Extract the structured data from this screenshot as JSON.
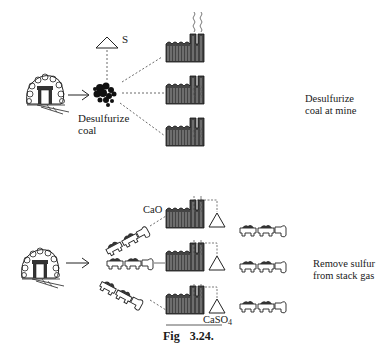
{
  "figure": {
    "caption_prefix": "Fig",
    "caption_number": "3.24."
  },
  "top_panel": {
    "sulfur_label": "S",
    "coal_label_line1": "Desulfurize",
    "coal_label_line2": "coal",
    "side_label_line1": "Desulfurize",
    "side_label_line2": "coal at mine",
    "power_plants": 3
  },
  "bottom_panel": {
    "reagent_label": "CaO",
    "product_label_main": "CaSO",
    "product_label_sub": "4",
    "side_label_line1": "Remove sulfur",
    "side_label_line2": "from stack gas",
    "power_plants": 3,
    "trains_in": 3,
    "trains_out": 3
  }
}
